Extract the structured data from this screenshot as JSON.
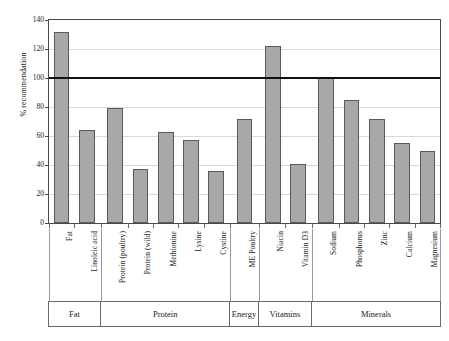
{
  "chart_data": {
    "type": "bar",
    "title": "",
    "xlabel": "",
    "ylabel": "% recommendation",
    "ylim": [
      0,
      140
    ],
    "yticks": [
      0,
      20,
      40,
      60,
      80,
      100,
      120,
      140
    ],
    "grid": true,
    "legend": "none",
    "categories": [
      "Fat",
      "Linoleic acid",
      "Protein (poultry)",
      "Protein (wild)",
      "Methionine",
      "Lysine",
      "Cystine",
      "ME Poultry",
      "Niacin",
      "Vitamin D3",
      "Sodium",
      "Phosphorus",
      "Zinc",
      "Calcium",
      "Magnesium"
    ],
    "values": [
      132,
      64,
      79,
      37,
      63,
      57,
      36,
      72,
      122,
      41,
      101,
      85,
      72,
      55,
      50
    ],
    "bar_color": "#a8a8a8",
    "bar_edge_color": "#5a5a5a",
    "reference_line": {
      "value": 100,
      "color": "#111111",
      "label": ""
    },
    "groups": [
      {
        "label": "Fat",
        "count": 2
      },
      {
        "label": "Protein",
        "count": 5
      },
      {
        "label": "Energy",
        "count": 1
      },
      {
        "label": "Vitamins",
        "count": 2
      },
      {
        "label": "Minerals",
        "count": 5
      }
    ]
  }
}
